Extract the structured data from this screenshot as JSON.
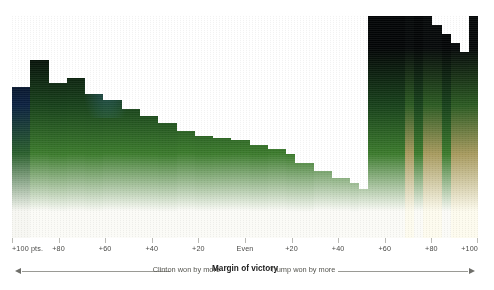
{
  "chart_data": {
    "type": "bar",
    "title": "",
    "xlabel": "Margin of victory",
    "ylabel": "",
    "grid": false,
    "legend_position": "below-axis",
    "axis": {
      "ticks": [
        {
          "label": "+100 pts.",
          "pos_pct": 0.0
        },
        {
          "label": "+80",
          "pos_pct": 10.0
        },
        {
          "label": "+60",
          "pos_pct": 20.0
        },
        {
          "label": "+40",
          "pos_pct": 30.0
        },
        {
          "label": "+20",
          "pos_pct": 40.0
        },
        {
          "label": "Even",
          "pos_pct": 50.0
        },
        {
          "label": "+20",
          "pos_pct": 60.0
        },
        {
          "label": "+40",
          "pos_pct": 70.0
        },
        {
          "label": "+60",
          "pos_pct": 80.0
        },
        {
          "label": "+80",
          "pos_pct": 90.0
        },
        {
          "label": "+100",
          "pos_pct": 100.0
        }
      ],
      "left_direction_label": "Clinton won by more",
      "right_direction_label": "Trump won by more",
      "center_label": "Margin of victory"
    },
    "colors": {
      "bar_top": "#000000",
      "bar_green": "#2f6b22",
      "bar_bottom": "#ffffff",
      "bar_tan": "#c8b77a",
      "bar_blue_haze": "#28488c",
      "tick": "#b9b9b4",
      "label_text": "#4a4a48",
      "center_text": "#1b1b1b",
      "arrow": "#9a9a95",
      "background": "#ffffff"
    },
    "categories": [
      "+100",
      "+96",
      "+92",
      "+88",
      "+84",
      "+80",
      "+76",
      "+72",
      "+68",
      "+64",
      "+60",
      "+56",
      "+52",
      "+48",
      "+44",
      "+40",
      "+36",
      "+32",
      "+28",
      "+24",
      "+20",
      "+16",
      "+12",
      "+8",
      "+4",
      "Even",
      "+4",
      "+8",
      "+12",
      "+16",
      "+20",
      "+24",
      "+28",
      "+32",
      "+36",
      "+40",
      "+44",
      "+48",
      "+52",
      "+56",
      "+60",
      "+64",
      "+68",
      "+72",
      "+76",
      "+80",
      "+84",
      "+88",
      "+92",
      "+96",
      "+100"
    ],
    "values": [
      68,
      68,
      80,
      80,
      70,
      70,
      72,
      72,
      65,
      65,
      62,
      62,
      58,
      58,
      55,
      55,
      52,
      52,
      48,
      48,
      46,
      46,
      45,
      45,
      44,
      44,
      42,
      42,
      40,
      40,
      38,
      34,
      34,
      30,
      30,
      27,
      27,
      25,
      22,
      100,
      100,
      100,
      100,
      100,
      100,
      100,
      96,
      92,
      88,
      84,
      100
    ],
    "series": [
      {
        "name": "Share of counties by margin of victory",
        "values": [
          68,
          68,
          80,
          80,
          70,
          70,
          72,
          72,
          65,
          65,
          62,
          62,
          58,
          58,
          55,
          55,
          52,
          52,
          48,
          48,
          46,
          46,
          45,
          45,
          44,
          44,
          42,
          42,
          40,
          40,
          38,
          34,
          34,
          30,
          30,
          27,
          27,
          25,
          22,
          100,
          100,
          100,
          100,
          100,
          100,
          100,
          96,
          92,
          88,
          84,
          100
        ]
      }
    ],
    "column_tints": [
      "blue",
      "blue",
      "neutral",
      "neutral",
      "neutral",
      "neutral",
      "neutral",
      "neutral",
      "neutral",
      "neutral",
      "neutral",
      "neutral",
      "neutral",
      "neutral",
      "neutral",
      "neutral",
      "neutral",
      "neutral",
      "neutral",
      "neutral",
      "neutral",
      "neutral",
      "neutral",
      "neutral",
      "neutral",
      "neutral",
      "neutral",
      "neutral",
      "neutral",
      "neutral",
      "neutral",
      "neutral",
      "neutral",
      "neutral",
      "neutral",
      "neutral",
      "neutral",
      "neutral",
      "neutral",
      "neutral",
      "neutral",
      "neutral",
      "neutral",
      "tan",
      "neutral",
      "tan",
      "tan",
      "neutral",
      "tan",
      "tan",
      "tan"
    ]
  }
}
